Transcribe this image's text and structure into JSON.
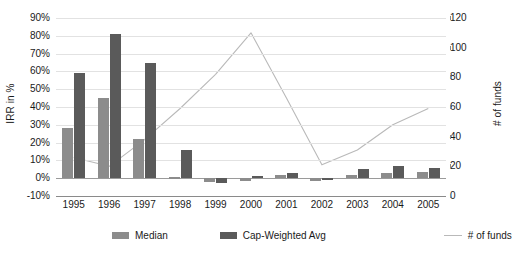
{
  "chart_data": {
    "type": "bar",
    "title": "",
    "xlabel": "",
    "ylabel": "IRR in %",
    "y2label": "# of funds",
    "categories": [
      "1995",
      "1996",
      "1997",
      "1998",
      "1999",
      "2000",
      "2001",
      "2002",
      "2003",
      "2004",
      "2005"
    ],
    "ylim": [
      -10,
      90
    ],
    "y2lim": [
      0,
      120
    ],
    "ytick_labels": [
      "90%",
      "80%",
      "70%",
      "60%",
      "50%",
      "40%",
      "30%",
      "20%",
      "10%",
      "0%",
      "-10%"
    ],
    "ytick_values": [
      90,
      80,
      70,
      60,
      50,
      40,
      30,
      20,
      10,
      0,
      -10
    ],
    "y2tick_labels": [
      "120",
      "100",
      "80",
      "60",
      "40",
      "20",
      "0"
    ],
    "y2tick_values": [
      120,
      100,
      80,
      60,
      40,
      20,
      0
    ],
    "grid": true,
    "legend_position": "bottom",
    "series": [
      {
        "name": "Median",
        "type": "bar",
        "axis": "left",
        "color": "#8c8c8c",
        "values": [
          28,
          45,
          22,
          0.5,
          -2,
          -1.5,
          2,
          -1.5,
          2,
          3,
          3.5
        ]
      },
      {
        "name": "Cap-Weighted Avg",
        "type": "bar",
        "axis": "left",
        "color": "#5a5a5a",
        "values": [
          59,
          81,
          65,
          16,
          -2.5,
          1,
          3,
          -1,
          5,
          7,
          6
        ]
      },
      {
        "name": "# of funds",
        "type": "line",
        "axis": "right",
        "color": "#b9b9b9",
        "values": [
          26,
          20,
          38,
          59,
          82,
          110,
          66,
          21,
          31,
          48,
          59
        ]
      }
    ]
  },
  "legend": {
    "items": [
      {
        "label": "Median",
        "swatch": "bar",
        "color": "#8c8c8c"
      },
      {
        "label": "Cap-Weighted Avg",
        "swatch": "bar",
        "color": "#5a5a5a"
      },
      {
        "label": "# of funds",
        "swatch": "line",
        "color": "#b9b9b9"
      }
    ]
  }
}
